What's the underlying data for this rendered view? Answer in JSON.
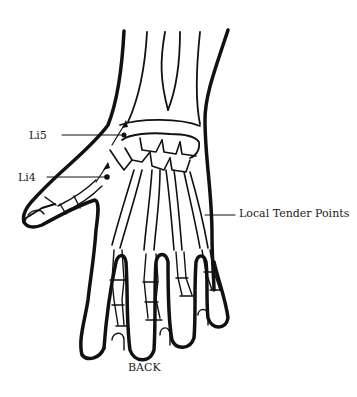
{
  "diagram": {
    "view_label": "BACK",
    "points": [
      {
        "id": "li5",
        "label": "Li5"
      },
      {
        "id": "li4",
        "label": "Li4"
      }
    ],
    "callouts": {
      "tender": "Local Tender Points"
    },
    "colors": {
      "line": "#111111",
      "background": "#ffffff"
    }
  }
}
